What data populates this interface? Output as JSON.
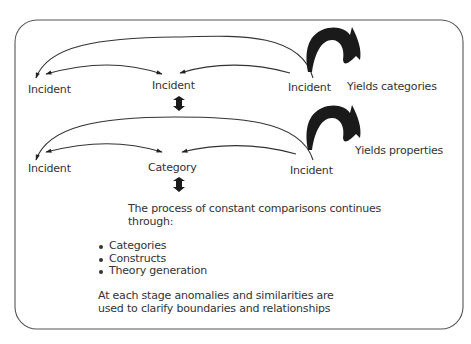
{
  "diagram": {
    "row1": {
      "nodes": [
        {
          "label": "Incident"
        },
        {
          "label": "Incident"
        },
        {
          "label": "Incident"
        }
      ],
      "yield_label": "Yields categories"
    },
    "row2": {
      "nodes": [
        {
          "label": "Incident"
        },
        {
          "label": "Category"
        },
        {
          "label": "Incident"
        }
      ],
      "yield_label": "Yields properties"
    },
    "description": {
      "intro": "The process of constant comparisons continues through:",
      "items": [
        "Categories",
        "Constructs",
        "Theory generation"
      ],
      "conclusion": "At each stage anomalies and similarities are used to clarify boundaries and relationships"
    },
    "colors": {
      "stroke": "#333333",
      "fill": "#1a1a1a",
      "frame": "#555555"
    }
  }
}
